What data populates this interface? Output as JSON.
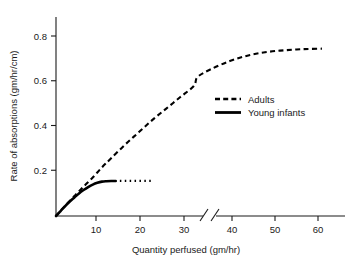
{
  "chart_data": {
    "type": "line",
    "title": "",
    "xlabel": "Quantity perfused (gm/hr)",
    "ylabel": "Rate of absorptions (gm/hr/cm)",
    "xlim": [
      0,
      65
    ],
    "ylim": [
      0,
      0.88
    ],
    "grid": false,
    "axis_break": {
      "from": 32,
      "to": 37,
      "label": "//"
    },
    "legend_position": "center-right",
    "xticks": [
      10,
      20,
      30,
      40,
      50,
      60
    ],
    "xtick_labels": [
      "10",
      "20",
      "30",
      "40",
      "50",
      "60"
    ],
    "yticks": [
      0.2,
      0.4,
      0.6,
      0.8
    ],
    "ytick_labels": [
      "0.2",
      "0.4",
      "0.6",
      "0.8"
    ],
    "series": [
      {
        "name": "Adults",
        "style": "dashed",
        "color": "#000000",
        "x": [
          0,
          2,
          4,
          6,
          8,
          10,
          12,
          15,
          18,
          21,
          24,
          27,
          30,
          33,
          36,
          40,
          44,
          48,
          52,
          56,
          60
        ],
        "values": [
          0.0,
          0.045,
          0.088,
          0.13,
          0.17,
          0.215,
          0.255,
          0.315,
          0.37,
          0.425,
          0.475,
          0.525,
          0.575,
          0.615,
          0.65,
          0.685,
          0.71,
          0.725,
          0.733,
          0.738,
          0.74
        ]
      },
      {
        "name": "Young infants",
        "style": "solid",
        "color": "#000000",
        "x": [
          0,
          1,
          2,
          3,
          4,
          5,
          6,
          7,
          8,
          9,
          10,
          11,
          12,
          13
        ],
        "values": [
          0.0,
          0.022,
          0.044,
          0.064,
          0.082,
          0.1,
          0.115,
          0.128,
          0.139,
          0.147,
          0.152,
          0.154,
          0.155,
          0.155
        ]
      },
      {
        "name": "Young infants (extrapolated)",
        "style": "dotted",
        "color": "#000000",
        "x": [
          13,
          21
        ],
        "values": [
          0.155,
          0.155
        ]
      }
    ],
    "legend_entries": [
      {
        "label": "Adults",
        "style": "dashed"
      },
      {
        "label": "Young infants",
        "style": "solid"
      }
    ]
  }
}
